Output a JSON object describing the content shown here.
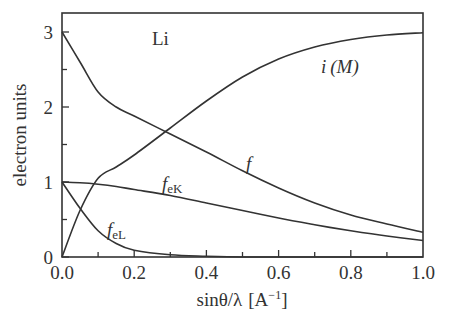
{
  "chart_data": {
    "type": "line",
    "title": "",
    "annotation": "Li",
    "xlabel": "sinθ/λ [A⁻¹]",
    "ylabel": "electron units",
    "xlim": [
      0.0,
      1.0
    ],
    "ylim": [
      0,
      3.2
    ],
    "x_ticks": [
      "0.0",
      "0.2",
      "0.4",
      "0.6",
      "0.8",
      "1.0"
    ],
    "y_ticks": [
      "0",
      "1",
      "2",
      "3"
    ],
    "grid": false,
    "legend": "inline labels",
    "x": [
      0.0,
      0.05,
      0.1,
      0.15,
      0.2,
      0.3,
      0.4,
      0.5,
      0.6,
      0.7,
      0.8,
      0.9,
      1.0
    ],
    "series": [
      {
        "name": "f",
        "label": "f",
        "values": [
          3.0,
          2.6,
          2.2,
          2.0,
          1.88,
          1.64,
          1.4,
          1.15,
          0.92,
          0.72,
          0.56,
          0.44,
          0.33
        ]
      },
      {
        "name": "i(M)",
        "label": "i (M)",
        "values": [
          0.0,
          0.62,
          1.05,
          1.2,
          1.36,
          1.72,
          2.08,
          2.4,
          2.64,
          2.8,
          2.9,
          2.96,
          2.99
        ]
      },
      {
        "name": "f_eK",
        "label": "f_eK",
        "values": [
          1.0,
          0.99,
          0.97,
          0.94,
          0.9,
          0.82,
          0.72,
          0.62,
          0.52,
          0.43,
          0.35,
          0.28,
          0.22
        ]
      },
      {
        "name": "f_eL",
        "label": "f_eL",
        "values": [
          1.0,
          0.65,
          0.35,
          0.18,
          0.09,
          0.03,
          0.01,
          0.0,
          0.0,
          0.0,
          0.0,
          0.0,
          0.0
        ]
      }
    ]
  },
  "labels": {
    "annotation": "Li",
    "ylabel": "electron units",
    "xlabel_main": "sinθ/λ",
    "xlabel_unit": "[A",
    "xlabel_exp": "−1",
    "xlabel_close": "]",
    "series_f": "f",
    "series_i": "i",
    "series_i_arg": "(M)",
    "series_feK_main": "f",
    "series_feK_sub": "eK",
    "series_feL_main": "f",
    "series_feL_sub": "eL"
  }
}
